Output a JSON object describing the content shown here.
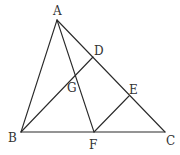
{
  "diagram": {
    "type": "geometry",
    "points": {
      "A": {
        "x": 57,
        "y": 20
      },
      "B": {
        "x": 21,
        "y": 132
      },
      "C": {
        "x": 165,
        "y": 132
      },
      "D": {
        "x": 93,
        "y": 57
      },
      "E": {
        "x": 129,
        "y": 96
      },
      "F": {
        "x": 94,
        "y": 132
      },
      "G": {
        "x": 76,
        "y": 75
      }
    },
    "segments": [
      [
        "A",
        "B"
      ],
      [
        "A",
        "C"
      ],
      [
        "B",
        "C"
      ],
      [
        "A",
        "F"
      ],
      [
        "B",
        "D"
      ],
      [
        "F",
        "E"
      ]
    ],
    "labels": {
      "A": {
        "text": "A",
        "x": 53,
        "y": 15
      },
      "B": {
        "text": "B",
        "x": 8,
        "y": 142
      },
      "C": {
        "text": "C",
        "x": 166,
        "y": 145
      },
      "D": {
        "text": "D",
        "x": 94,
        "y": 55
      },
      "E": {
        "text": "E",
        "x": 129,
        "y": 94
      },
      "F": {
        "text": "F",
        "x": 89,
        "y": 149
      },
      "G": {
        "text": "G",
        "x": 67,
        "y": 92
      }
    },
    "colors": {
      "stroke": "#2a2a2a",
      "label": "#333333",
      "background": "#ffffff"
    }
  }
}
